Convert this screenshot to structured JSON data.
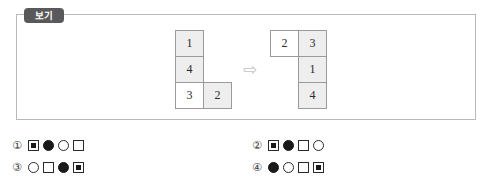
{
  "example": {
    "tab_label": "보기",
    "arrow_glyph": "⇨",
    "arrow_icon_name": "right-arrow-icon",
    "left_figure": {
      "name": "left-polyomino",
      "cells": [
        {
          "value": "1",
          "col": 0,
          "row": 0,
          "shaded": true
        },
        {
          "value": "4",
          "col": 0,
          "row": 1,
          "shaded": true
        },
        {
          "value": "3",
          "col": 0,
          "row": 2,
          "shaded": false
        },
        {
          "value": "2",
          "col": 1,
          "row": 2,
          "shaded": true
        }
      ]
    },
    "right_figure": {
      "name": "right-polyomino",
      "cells": [
        {
          "value": "2",
          "col": 0,
          "row": 0,
          "shaded": false
        },
        {
          "value": "3",
          "col": 1,
          "row": 0,
          "shaded": true
        },
        {
          "value": "1",
          "col": 1,
          "row": 1,
          "shaded": true
        },
        {
          "value": "4",
          "col": 1,
          "row": 2,
          "shaded": true
        }
      ]
    }
  },
  "options": [
    {
      "number": "①",
      "name": "option-1",
      "symbols": [
        "square-nested",
        "circle-filled",
        "circle-empty",
        "square-empty"
      ]
    },
    {
      "number": "②",
      "name": "option-2",
      "symbols": [
        "square-nested",
        "circle-filled",
        "square-empty",
        "circle-empty"
      ]
    },
    {
      "number": "③",
      "name": "option-3",
      "symbols": [
        "circle-empty",
        "square-empty",
        "circle-filled",
        "square-nested"
      ]
    },
    {
      "number": "④",
      "name": "option-4",
      "symbols": [
        "circle-filled",
        "circle-empty",
        "square-empty",
        "square-nested"
      ]
    }
  ],
  "colors": {
    "box_border": "#b9b9b9",
    "tab_background": "#59595b",
    "cell_border": "#9a9a9a",
    "cell_shaded": "#eeeeee",
    "cell_plain": "#ffffff",
    "arrow": "#c3c3c3",
    "text": "#2a2a2a"
  }
}
